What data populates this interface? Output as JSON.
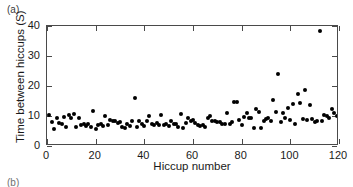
{
  "figure": {
    "panel_a_label": "(a)",
    "panel_b_label": "(b)"
  },
  "chart_data": {
    "type": "scatter",
    "title": "",
    "xlabel": "Hiccup number",
    "ylabel": "Time between hiccups (S)",
    "xlim": [
      0,
      120
    ],
    "ylim": [
      0,
      40
    ],
    "xticks": [
      0,
      20,
      40,
      60,
      80,
      100,
      120
    ],
    "yticks": [
      0,
      10,
      20,
      30,
      40
    ],
    "grid": false,
    "legend": null,
    "marker": "filled-circle",
    "marker_color": "#000000",
    "series": [
      {
        "name": "Time between hiccups",
        "x": [
          1,
          2,
          3,
          4,
          5,
          6,
          7,
          8,
          9,
          10,
          11,
          12,
          13,
          14,
          15,
          16,
          17,
          18,
          19,
          20,
          21,
          22,
          23,
          24,
          25,
          26,
          27,
          28,
          29,
          30,
          31,
          32,
          33,
          34,
          35,
          36,
          37,
          38,
          39,
          40,
          41,
          42,
          43,
          44,
          45,
          46,
          47,
          48,
          49,
          50,
          51,
          52,
          53,
          54,
          55,
          56,
          57,
          58,
          59,
          60,
          61,
          62,
          63,
          64,
          65,
          66,
          67,
          68,
          69,
          70,
          71,
          72,
          73,
          74,
          75,
          76,
          77,
          78,
          79,
          80,
          81,
          82,
          83,
          84,
          85,
          86,
          87,
          88,
          89,
          90,
          91,
          92,
          93,
          94,
          95,
          96,
          97,
          98,
          99,
          100,
          101,
          102,
          103,
          104,
          105,
          106,
          107,
          108,
          109,
          110,
          111,
          112,
          113,
          114,
          115,
          116,
          117,
          118,
          119,
          120
        ],
        "values": [
          10.2,
          8.0,
          5.6,
          9.3,
          7.6,
          7.3,
          9.7,
          6.2,
          10.2,
          9.2,
          10.6,
          6.3,
          9.5,
          7.1,
          7.2,
          6.6,
          7.3,
          6.4,
          11.7,
          5.6,
          7.0,
          7.2,
          6.6,
          9.9,
          7.0,
          8.6,
          8.3,
          8.2,
          7.8,
          7.9,
          6.4,
          6.1,
          7.2,
          6.6,
          8.5,
          15.9,
          6.2,
          8.2,
          7.3,
          6.6,
          8.2,
          9.9,
          7.2,
          6.9,
          7.7,
          7.0,
          10.2,
          7.1,
          7.3,
          6.6,
          8.3,
          7.5,
          7.2,
          6.5,
          10.7,
          6.0,
          7.8,
          9.3,
          8.3,
          8.8,
          7.6,
          7.1,
          6.7,
          7.1,
          6.4,
          9.3,
          10.1,
          8.4,
          8.5,
          8.0,
          8.1,
          7.2,
          7.3,
          11.0,
          7.5,
          8.1,
          14.7,
          14.6,
          8.8,
          7.1,
          9.8,
          11.0,
          9.5,
          9.4,
          6.1,
          12.2,
          11.3,
          5.9,
          8.4,
          9.0,
          9.3,
          8.3,
          15.2,
          11.3,
          23.9,
          8.1,
          10.9,
          9.2,
          12.6,
          8.7,
          14.1,
          7.5,
          17.3,
          14.2,
          8.9,
          18.6,
          8.7,
          13.8,
          9.1,
          7.9,
          8.4,
          38.4,
          8.3,
          10.5,
          10.0,
          9.3,
          12.4,
          11.1,
          10.0,
          9.4
        ]
      }
    ]
  }
}
